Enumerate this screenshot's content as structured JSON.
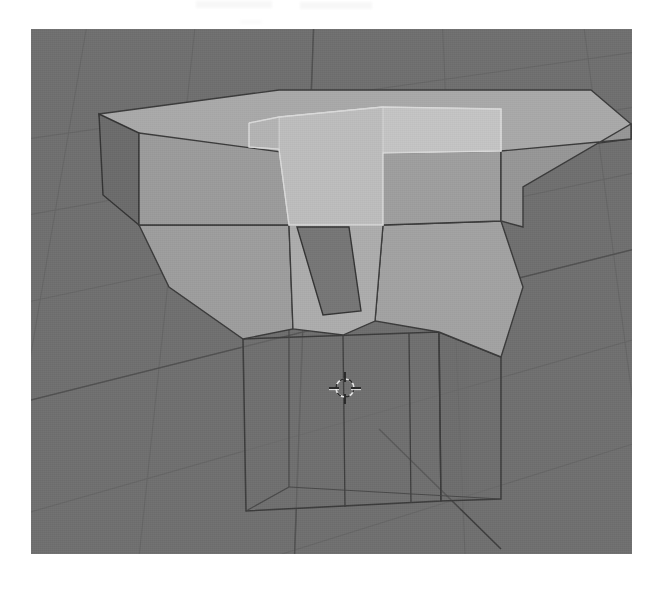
{
  "app": {
    "name": "Blender",
    "view_label": "3D Viewport",
    "editor_mode": "Edit Mode",
    "shading_mode": "Solid"
  },
  "viewport": {
    "x": 31,
    "y": 29,
    "width": 601,
    "height": 525,
    "background_color": "#6f6f6f",
    "grid": {
      "visible": true,
      "line_color": "#646464",
      "axis_line_color": "#4e4e4e",
      "vertical_lines": 9,
      "horizontal_lines": 8
    }
  },
  "colors": {
    "background": "#6f6f6f",
    "face_top": "#a8a8a8",
    "face_front": "#9a9a9a",
    "face_side_dark": "#6a6a6a",
    "face_selected_top": "#c2c2c2",
    "face_selected_front": "#bcbcbc",
    "face_funnel": "#a0a0a0",
    "face_funnel_inner_dark": "#757575",
    "wire_edge": "#3a3a3a",
    "wire_edge_soft": "#555555",
    "cursor_ring": "#e0e0e0",
    "cursor_cross": "#2a2a2a"
  },
  "model": {
    "name": "funnel-block-mesh",
    "description": "Box top slab tapering through a funnel into a wireframe cube base",
    "parts": [
      {
        "name": "top-slab",
        "shading": "shaded"
      },
      {
        "name": "selected-center-block",
        "shading": "highlighted"
      },
      {
        "name": "funnel-taper",
        "shading": "shaded"
      },
      {
        "name": "base-cube",
        "shading": "wireframe"
      }
    ]
  },
  "cursor_3d": {
    "name": "3d-cursor",
    "x": 345,
    "y": 388,
    "radius": 9
  },
  "page": {
    "width": 663,
    "height": 596,
    "paper_color": "#ffffff"
  },
  "artifacts": {
    "note": "faint scan marks along the top margin"
  }
}
